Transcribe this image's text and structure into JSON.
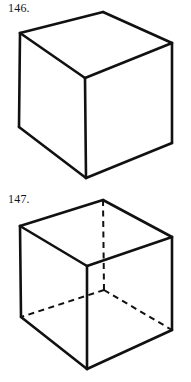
{
  "page": {
    "background_color": "#ffffff",
    "ink_color": "#111111",
    "width": 191,
    "height": 382
  },
  "figures": [
    {
      "id": "146",
      "label": "146.",
      "caption": "",
      "description": "Opaque cube drawn in isometric-style perspective with hidden edges omitted",
      "line_style": "solid",
      "hidden_edges_shown": false,
      "vertices": {
        "top_back": [
          103,
          12
        ],
        "top_left": [
          20,
          33
        ],
        "top_right": [
          172,
          43
        ],
        "top_front": [
          85,
          78
        ],
        "bottom_left": [
          19,
          127
        ],
        "bottom_right": [
          172,
          143
        ],
        "bottom_front": [
          86,
          178
        ]
      },
      "visible_edges": [
        [
          "top_back",
          "top_left"
        ],
        [
          "top_back",
          "top_right"
        ],
        [
          "top_left",
          "top_front"
        ],
        [
          "top_right",
          "top_front"
        ],
        [
          "top_left",
          "bottom_left"
        ],
        [
          "top_right",
          "bottom_right"
        ],
        [
          "top_front",
          "bottom_front"
        ],
        [
          "bottom_left",
          "bottom_front"
        ],
        [
          "bottom_right",
          "bottom_front"
        ]
      ],
      "hidden_edges": []
    },
    {
      "id": "147",
      "label": "147.",
      "caption": "",
      "description": "Transparent wireframe cube with three hidden edges drawn as dashed lines meeting at the far back-bottom corner",
      "line_style": "solid-with-dashed-hidden",
      "hidden_edges_shown": true,
      "vertices": {
        "top_back": [
          103,
          200
        ],
        "top_left": [
          20,
          226
        ],
        "top_right": [
          172,
          237
        ],
        "top_front": [
          87,
          266
        ],
        "bottom_left": [
          21,
          317
        ],
        "bottom_right": [
          172,
          330
        ],
        "bottom_front": [
          87,
          369
        ],
        "bottom_back": [
          104,
          290
        ]
      },
      "visible_edges": [
        [
          "top_back",
          "top_left"
        ],
        [
          "top_back",
          "top_right"
        ],
        [
          "top_left",
          "top_front"
        ],
        [
          "top_right",
          "top_front"
        ],
        [
          "top_left",
          "bottom_left"
        ],
        [
          "top_right",
          "bottom_right"
        ],
        [
          "top_front",
          "bottom_front"
        ],
        [
          "bottom_left",
          "bottom_front"
        ],
        [
          "bottom_right",
          "bottom_front"
        ]
      ],
      "hidden_edges": [
        [
          "top_back",
          "bottom_back"
        ],
        [
          "bottom_back",
          "bottom_left"
        ],
        [
          "bottom_back",
          "bottom_right"
        ]
      ]
    }
  ]
}
